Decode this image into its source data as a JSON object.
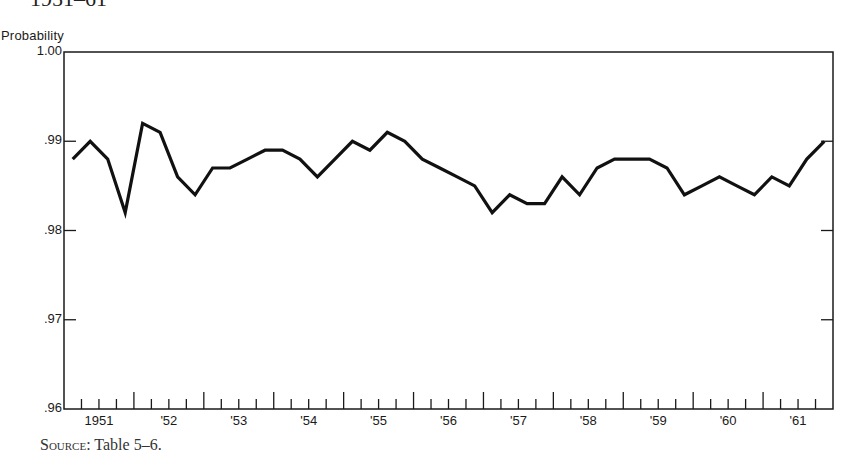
{
  "header": {
    "title_fragment": "1951–61"
  },
  "axes": {
    "ylabel": "Probability",
    "yticks": [
      "1.00",
      ".99",
      ".98",
      ".97",
      ".96"
    ],
    "xticks": [
      "1951",
      "'52",
      "'53",
      "'54",
      "'55",
      "'56",
      "'57",
      "'58",
      "'59",
      "'60",
      "'61"
    ]
  },
  "footer": {
    "source_prefix": "Source",
    "source_text": ": Table 5–6."
  },
  "chart_data": {
    "type": "line",
    "title": "",
    "xlabel": "",
    "ylabel": "Probability",
    "ylim": [
      0.96,
      1.0
    ],
    "yticks": [
      0.96,
      0.97,
      0.98,
      0.99,
      1.0
    ],
    "x_unit": "quarter",
    "x_range": [
      "1951 Q1",
      "1961 Q4"
    ],
    "grid": false,
    "legend": null,
    "categories": [
      "1951 Q1",
      "1951 Q2",
      "1951 Q3",
      "1951 Q4",
      "1952 Q1",
      "1952 Q2",
      "1952 Q3",
      "1952 Q4",
      "1953 Q1",
      "1953 Q2",
      "1953 Q3",
      "1953 Q4",
      "1954 Q1",
      "1954 Q2",
      "1954 Q3",
      "1954 Q4",
      "1955 Q1",
      "1955 Q2",
      "1955 Q3",
      "1955 Q4",
      "1956 Q1",
      "1956 Q2",
      "1956 Q3",
      "1956 Q4",
      "1957 Q1",
      "1957 Q2",
      "1957 Q3",
      "1957 Q4",
      "1958 Q1",
      "1958 Q2",
      "1958 Q3",
      "1958 Q4",
      "1959 Q1",
      "1959 Q2",
      "1959 Q3",
      "1959 Q4",
      "1960 Q1",
      "1960 Q2",
      "1960 Q3",
      "1960 Q4",
      "1961 Q1",
      "1961 Q2",
      "1961 Q3",
      "1961 Q4"
    ],
    "series": [
      {
        "name": "Probability",
        "values": [
          0.988,
          0.99,
          0.988,
          0.982,
          0.992,
          0.991,
          0.986,
          0.984,
          0.987,
          0.987,
          0.988,
          0.989,
          0.989,
          0.988,
          0.986,
          0.988,
          0.99,
          0.989,
          0.991,
          0.99,
          0.988,
          0.987,
          0.986,
          0.985,
          0.982,
          0.984,
          0.983,
          0.983,
          0.986,
          0.984,
          0.987,
          0.988,
          0.988,
          0.988,
          0.987,
          0.984,
          0.985,
          0.986,
          0.985,
          0.984,
          0.986,
          0.985,
          0.988,
          0.99
        ]
      }
    ],
    "source": "Source: Table 5–6."
  }
}
